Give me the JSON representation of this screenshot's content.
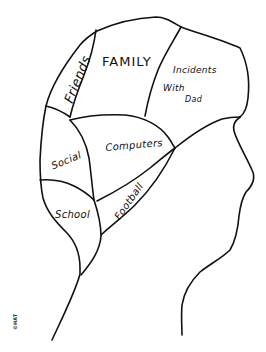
{
  "drawing": {
    "subject": "phrenology-style head profile divided into labeled regions",
    "stroke_color": "#111111",
    "background_color": "#ffffff"
  },
  "regions": [
    {
      "id": "friends",
      "label": "Friends"
    },
    {
      "id": "family",
      "label": "FAMILY"
    },
    {
      "id": "incidents",
      "label_lines": [
        "Incidents",
        "With",
        "Dad"
      ]
    },
    {
      "id": "social",
      "label": "Social"
    },
    {
      "id": "computers",
      "label": "Computers"
    },
    {
      "id": "football",
      "label": "Football"
    },
    {
      "id": "school",
      "label": "School"
    }
  ],
  "copyright": "©HAT"
}
